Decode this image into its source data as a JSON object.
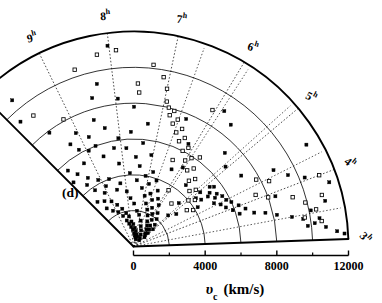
{
  "figure": {
    "panel_label": "(d)",
    "type": "polar-wedge-cone-diagram",
    "axis_label_main": "υ",
    "axis_label_sub": "c",
    "axis_label_unit": "(km/s)",
    "background": "#ffffff",
    "ink": "#000000"
  },
  "chart_data": {
    "type": "scatter",
    "title": "",
    "subtitle": "",
    "xlabel": "υc (km/s)",
    "ylabel": "",
    "projection": "polar-wedge",
    "grid": true,
    "legend_position": "none",
    "radial_axis": {
      "name": "velocity",
      "unit": "km/s",
      "min": 0,
      "max": 12000,
      "tick_labels": [
        "0",
        "4000",
        "8000",
        "12000"
      ],
      "tick_values": [
        0,
        4000,
        8000,
        12000
      ],
      "gridline_values": [
        2000,
        4000,
        6000,
        8000,
        10000,
        12000
      ]
    },
    "angular_axis": {
      "name": "right ascension",
      "unit": "hours",
      "min_hour": 3,
      "max_hour": 10,
      "tick_labels": [
        "3",
        "4",
        "5",
        "6",
        "7",
        "8",
        "9",
        "10"
      ],
      "tick_suffix": "h",
      "tick_hours": [
        3,
        4,
        5,
        6,
        7,
        8,
        9,
        10
      ]
    },
    "series": [
      {
        "name": "filled",
        "marker": "filled-square",
        "points_ra_v": [
          [
            9.72,
            10600
          ],
          [
            9.55,
            7900
          ],
          [
            9.3,
            6700
          ],
          [
            9.62,
            5100
          ],
          [
            9.4,
            4600
          ],
          [
            9.25,
            5400
          ],
          [
            9.18,
            6200
          ],
          [
            9.05,
            7100
          ],
          [
            8.95,
            5900
          ],
          [
            9.1,
            4200
          ],
          [
            8.8,
            6600
          ],
          [
            8.72,
            6000
          ],
          [
            8.6,
            5300
          ],
          [
            8.55,
            7400
          ],
          [
            8.45,
            8600
          ],
          [
            8.35,
            6800
          ],
          [
            8.3,
            9300
          ],
          [
            8.22,
            5600
          ],
          [
            8.15,
            4700
          ],
          [
            8.05,
            6100
          ],
          [
            8.02,
            11300
          ],
          [
            7.95,
            8300
          ],
          [
            7.85,
            5500
          ],
          [
            7.78,
            4100
          ],
          [
            7.7,
            6400
          ],
          [
            7.62,
            7800
          ],
          [
            7.55,
            5000
          ],
          [
            7.48,
            3700
          ],
          [
            7.4,
            4500
          ],
          [
            7.35,
            5800
          ],
          [
            7.28,
            6900
          ],
          [
            7.2,
            3300
          ],
          [
            7.12,
            4000
          ],
          [
            7.05,
            5200
          ],
          [
            6.98,
            2900
          ],
          [
            6.9,
            3600
          ],
          [
            6.85,
            4300
          ],
          [
            6.78,
            2500
          ],
          [
            6.7,
            3100
          ],
          [
            6.62,
            3900
          ],
          [
            6.55,
            2200
          ],
          [
            6.48,
            2800
          ],
          [
            6.4,
            3400
          ],
          [
            6.35,
            1900
          ],
          [
            6.28,
            2400
          ],
          [
            6.2,
            3000
          ],
          [
            6.12,
            1600
          ],
          [
            6.05,
            2100
          ],
          [
            5.98,
            2700
          ],
          [
            5.9,
            1400
          ],
          [
            5.82,
            1800
          ],
          [
            5.75,
            2300
          ],
          [
            5.68,
            1200
          ],
          [
            5.6,
            1500
          ],
          [
            5.52,
            2000
          ],
          [
            5.45,
            1000
          ],
          [
            5.38,
            1300
          ],
          [
            5.3,
            1700
          ],
          [
            5.22,
            900
          ],
          [
            5.15,
            1100
          ],
          [
            5.08,
            1450
          ],
          [
            5.0,
            800
          ],
          [
            9.85,
            9400
          ],
          [
            9.68,
            3200
          ],
          [
            9.48,
            2600
          ],
          [
            9.35,
            3000
          ],
          [
            9.2,
            2300
          ],
          [
            9.0,
            2800
          ],
          [
            8.88,
            2100
          ],
          [
            8.75,
            2500
          ],
          [
            8.62,
            1800
          ],
          [
            8.5,
            2200
          ],
          [
            8.4,
            1500
          ],
          [
            8.28,
            1900
          ],
          [
            8.18,
            1300
          ],
          [
            8.08,
            1700
          ],
          [
            7.98,
            1100
          ],
          [
            7.88,
            1400
          ],
          [
            7.75,
            950
          ],
          [
            7.65,
            1250
          ],
          [
            7.52,
            750
          ],
          [
            7.42,
            1050
          ],
          [
            7.3,
            620
          ],
          [
            7.18,
            880
          ],
          [
            7.02,
            520
          ],
          [
            6.88,
            700
          ],
          [
            6.72,
            420
          ],
          [
            6.58,
            600
          ],
          [
            9.9,
            4900
          ],
          [
            9.78,
            5600
          ],
          [
            9.58,
            4300
          ],
          [
            9.44,
            3800
          ],
          [
            9.12,
            3400
          ],
          [
            8.92,
            3700
          ],
          [
            8.68,
            4000
          ],
          [
            8.48,
            3300
          ],
          [
            8.25,
            3600
          ],
          [
            8.0,
            3100
          ],
          [
            7.82,
            2700
          ],
          [
            7.58,
            2400
          ],
          [
            7.34,
            2000
          ],
          [
            7.1,
            1800
          ],
          [
            6.82,
            1500
          ],
          [
            6.6,
            1200
          ],
          [
            6.3,
            1000
          ],
          [
            6.02,
            780
          ],
          [
            5.7,
            600
          ],
          [
            5.4,
            480
          ],
          [
            4.9,
            5400
          ],
          [
            4.75,
            5200
          ],
          [
            4.82,
            5600
          ],
          [
            4.68,
            5000
          ],
          [
            4.6,
            5500
          ],
          [
            4.52,
            5300
          ],
          [
            4.45,
            5700
          ],
          [
            4.38,
            5100
          ],
          [
            4.3,
            5800
          ],
          [
            4.25,
            5400
          ],
          [
            4.18,
            6000
          ],
          [
            4.1,
            5600
          ],
          [
            4.02,
            6300
          ],
          [
            3.95,
            5900
          ],
          [
            3.88,
            6600
          ],
          [
            3.8,
            6200
          ],
          [
            4.95,
            4800
          ],
          [
            4.88,
            4400
          ],
          [
            4.72,
            4600
          ],
          [
            4.55,
            4200
          ],
          [
            3.72,
            7000
          ],
          [
            3.65,
            7600
          ],
          [
            3.55,
            8200
          ],
          [
            3.45,
            9000
          ],
          [
            3.38,
            9600
          ],
          [
            3.28,
            10200
          ],
          [
            3.2,
            10800
          ],
          [
            3.12,
            11400
          ],
          [
            3.5,
            10100
          ],
          [
            3.35,
            10500
          ],
          [
            3.25,
            9800
          ],
          [
            3.08,
            11800
          ],
          [
            4.4,
            8900
          ],
          [
            4.2,
            9500
          ],
          [
            4.05,
            10300
          ],
          [
            3.92,
            8400
          ],
          [
            5.6,
            8700
          ],
          [
            5.3,
            7300
          ],
          [
            5.85,
            9100
          ],
          [
            6.15,
            6500
          ],
          [
            6.45,
            7700
          ],
          [
            5.05,
            6800
          ],
          [
            4.65,
            7200
          ],
          [
            5.5,
            4500
          ],
          [
            5.95,
            5200
          ],
          [
            6.25,
            4800
          ],
          [
            5.2,
            3500
          ],
          [
            4.85,
            3000
          ],
          [
            3.6,
            11000
          ],
          [
            3.85,
            11500
          ],
          [
            4.5,
            11200
          ],
          [
            5.1,
            2600
          ]
        ]
      },
      {
        "name": "open",
        "marker": "open-square",
        "points_ra_v": [
          [
            9.6,
            9200
          ],
          [
            8.2,
            10900
          ],
          [
            7.9,
            11000
          ],
          [
            7.55,
            9100
          ],
          [
            7.52,
            8600
          ],
          [
            7.1,
            9600
          ],
          [
            7.0,
            9000
          ],
          [
            6.95,
            8300
          ],
          [
            6.88,
            8000
          ],
          [
            6.82,
            7600
          ],
          [
            6.75,
            7900
          ],
          [
            6.7,
            7200
          ],
          [
            6.62,
            7500
          ],
          [
            6.55,
            6800
          ],
          [
            6.45,
            7100
          ],
          [
            6.4,
            6400
          ],
          [
            6.3,
            6700
          ],
          [
            6.2,
            6000
          ],
          [
            6.1,
            6300
          ],
          [
            6.0,
            5600
          ],
          [
            5.88,
            5900
          ],
          [
            5.78,
            5200
          ],
          [
            5.65,
            5500
          ],
          [
            5.52,
            4800
          ],
          [
            5.4,
            5100
          ],
          [
            5.25,
            4400
          ],
          [
            5.12,
            4700
          ],
          [
            5.0,
            4000
          ],
          [
            4.85,
            4300
          ],
          [
            4.7,
            3600
          ],
          [
            4.55,
            3900
          ],
          [
            4.4,
            7800
          ],
          [
            4.25,
            8400
          ],
          [
            4.1,
            7400
          ],
          [
            3.95,
            8000
          ],
          [
            3.8,
            9300
          ],
          [
            3.65,
            9900
          ],
          [
            3.5,
            10400
          ],
          [
            3.4,
            9700
          ],
          [
            3.3,
            10600
          ],
          [
            3.7,
            10900
          ],
          [
            4.0,
            11100
          ],
          [
            5.7,
            6200
          ],
          [
            6.05,
            8800
          ],
          [
            7.3,
            10200
          ],
          [
            8.6,
            10400
          ],
          [
            9.15,
            8100
          ],
          [
            6.35,
            5300
          ],
          [
            5.95,
            3700
          ],
          [
            5.45,
            3200
          ]
        ]
      }
    ]
  },
  "ticks": {
    "radial": [
      {
        "value": 0,
        "label": "0"
      },
      {
        "value": 4000,
        "label": "4000"
      },
      {
        "value": 8000,
        "label": "8000"
      },
      {
        "value": 12000,
        "label": "12000"
      }
    ],
    "angular": [
      {
        "hour": 3,
        "label": "3"
      },
      {
        "hour": 4,
        "label": "4"
      },
      {
        "hour": 5,
        "label": "5"
      },
      {
        "hour": 6,
        "label": "6"
      },
      {
        "hour": 7,
        "label": "7"
      },
      {
        "hour": 8,
        "label": "8"
      },
      {
        "hour": 9,
        "label": "9"
      },
      {
        "hour": 10,
        "label": "10"
      }
    ],
    "hour_superscript": "h"
  }
}
